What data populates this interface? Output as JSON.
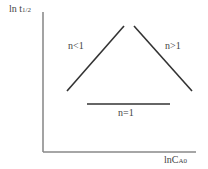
{
  "diagram": {
    "y_axis_label": {
      "main": "ln t",
      "sub": "1/2"
    },
    "x_axis_label": {
      "main": "lnC",
      "sub": "A0"
    },
    "lines": [
      {
        "label": "n<1",
        "x1": 67,
        "y1": 91,
        "x2": 124,
        "y2": 26
      },
      {
        "label": "n>1",
        "x1": 134,
        "y1": 26,
        "x2": 192,
        "y2": 91
      },
      {
        "label": "n=1",
        "x1": 87,
        "y1": 104,
        "x2": 170,
        "y2": 104
      }
    ],
    "colors": {
      "line": "#333333",
      "axis": "#777777"
    }
  }
}
